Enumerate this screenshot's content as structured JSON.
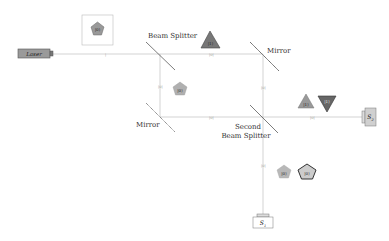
{
  "diagram": {
    "components": {
      "laser": "Laser",
      "beam_splitter": "Beam Splitter",
      "mirror_top": "Mirror",
      "mirror_bottom": "Mirror",
      "second_splitter_line1": "Second",
      "second_splitter_line2": "Beam Splitter",
      "detector_1": "S",
      "detector_1_sub": "1",
      "detector_2": "S",
      "detector_2_sub": "2"
    },
    "states": {
      "input_box": "|0⟩",
      "upper_path": "|1⟩",
      "lower_path": "|0⟩",
      "s2_a": "|1⟩",
      "s2_b": "|1⟩",
      "s1_a": "|0⟩",
      "s1_b": "|0⟩"
    },
    "path_ticks": {
      "laser_beam": "|",
      "upper_horizontal": "|0|",
      "left_vertical": "|0|",
      "lower_horizontal": "|0|",
      "right_vertical": "|0|",
      "s2_path": "|0|",
      "s1_path": "|0|"
    },
    "colors": {
      "beam": "#c8c8c8",
      "shape_light": "#b8b8b8",
      "shape_dark": "#6e6e6e",
      "device_fill": "#d0d0d0",
      "laser_fill": "#9a9a9a"
    }
  }
}
